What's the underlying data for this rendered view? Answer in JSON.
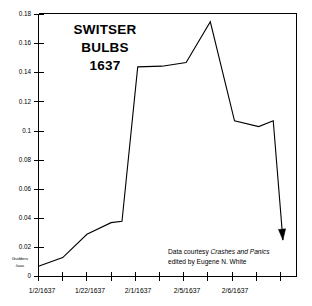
{
  "chart_data": {
    "type": "line",
    "title": "SWITSER BULBS 1637",
    "title_lines": [
      "SWITSER",
      "BULBS",
      "1637"
    ],
    "xlabel": "",
    "ylabel": "Guilders /aas",
    "ylabel_lines": [
      "Guilders",
      "/aas"
    ],
    "ylim": [
      0,
      0.18
    ],
    "y_ticks": [
      "0",
      "0.02",
      "0.04",
      "0.06",
      "0.08",
      "0.1",
      "0.12",
      "0.14",
      "0.16",
      "0.18"
    ],
    "y_tick_values": [
      0,
      0.02,
      0.04,
      0.06,
      0.08,
      0.1,
      0.12,
      0.14,
      0.16,
      0.18
    ],
    "x_tick_count": 11,
    "x_tick_labels": [
      "1/2/1637",
      "1/22/1637",
      "2/1/1637",
      "2/5/1637",
      "2/6/1637"
    ],
    "x_tick_label_indices": [
      0,
      2,
      4,
      6,
      8
    ],
    "x": [
      0,
      1,
      2,
      3,
      3.45,
      4.1,
      5.1,
      6.1,
      7.1,
      8.1,
      9.1,
      9.7,
      10.1
    ],
    "values": [
      0.007,
      0.013,
      0.029,
      0.037,
      0.038,
      0.144,
      0.1445,
      0.147,
      0.175,
      0.107,
      0.103,
      0.107,
      0.025
    ],
    "series": [
      {
        "name": "Switser bulb price",
        "values": [
          0.007,
          0.013,
          0.029,
          0.037,
          0.038,
          0.144,
          0.1445,
          0.147,
          0.175,
          0.107,
          0.103,
          0.107,
          0.025
        ]
      }
    ],
    "end_marker": "down-arrow",
    "grid": false,
    "legend": "none",
    "line_color": "#000000",
    "background_color": "#ffffff",
    "annotations": [
      {
        "name": "data-credit",
        "line1_plain": "Data courtesy ",
        "line1_italic": "Crashes and Panics",
        "line2": "edited by Eugene N. White"
      }
    ]
  },
  "figure": {
    "title_lines": [
      "SWITSER",
      "BULBS",
      "1637"
    ],
    "ylabel_lines": [
      "Guilders",
      "/aas"
    ],
    "credit": {
      "line1_plain": "Data courtesy ",
      "line1_italic": "Crashes and Panics",
      "line2": "edited by Eugene N. White"
    }
  }
}
